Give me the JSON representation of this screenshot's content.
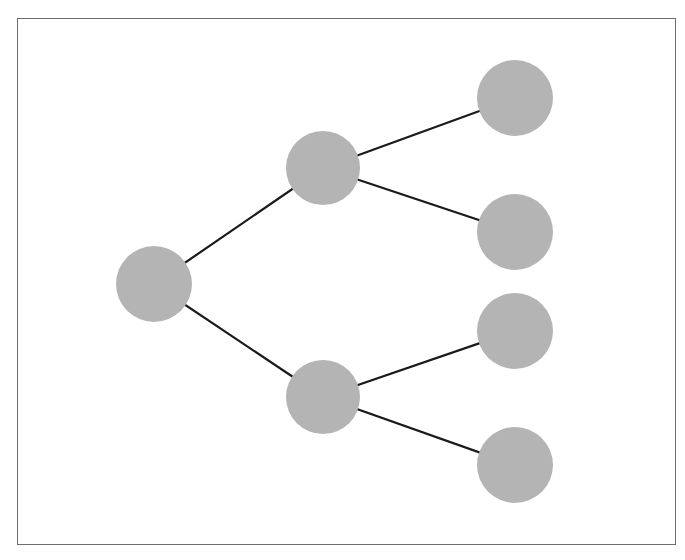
{
  "diagram": {
    "type": "tree",
    "frame": {
      "x": 17,
      "y": 18,
      "width": 659,
      "height": 527,
      "stroke": "#6e6e6e"
    },
    "node_color": "#b4b4b4",
    "edge_color": "#1a1a1a",
    "nodes": [
      {
        "id": "root",
        "x": 154,
        "y": 284,
        "r": 38
      },
      {
        "id": "mid-top",
        "x": 323,
        "y": 168,
        "r": 37
      },
      {
        "id": "mid-bottom",
        "x": 323,
        "y": 397,
        "r": 37
      },
      {
        "id": "leaf-1",
        "x": 515,
        "y": 98,
        "r": 38
      },
      {
        "id": "leaf-2",
        "x": 515,
        "y": 232,
        "r": 38
      },
      {
        "id": "leaf-3",
        "x": 515,
        "y": 331,
        "r": 38
      },
      {
        "id": "leaf-4",
        "x": 515,
        "y": 465,
        "r": 38
      }
    ],
    "edges": [
      {
        "from": "root",
        "to": "mid-top"
      },
      {
        "from": "root",
        "to": "mid-bottom"
      },
      {
        "from": "mid-top",
        "to": "leaf-1"
      },
      {
        "from": "mid-top",
        "to": "leaf-2"
      },
      {
        "from": "mid-bottom",
        "to": "leaf-3"
      },
      {
        "from": "mid-bottom",
        "to": "leaf-4"
      }
    ]
  }
}
